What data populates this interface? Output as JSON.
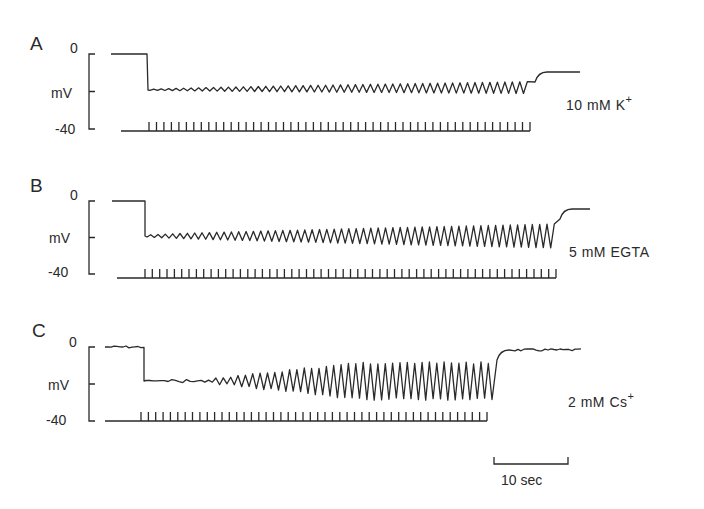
{
  "chart_data": {
    "type": "line",
    "title": "",
    "xlabel": "time",
    "ylabel": "mV",
    "scale_bar": {
      "label": "10 sec",
      "seconds": 10
    },
    "panels": [
      {
        "id": "A",
        "label": "A",
        "condition": "10 mM  K +",
        "y_ticks": [
          "0",
          "mV",
          "-40"
        ],
        "ylim": [
          -40,
          0
        ],
        "resting_mV": 0,
        "hyperpolarized_mV": -19,
        "recovery_mV": -9,
        "oscillation_amplitude_mV": {
          "start": 0.5,
          "end": 6
        },
        "stimulus_count": 52,
        "description": "Small oscillations grow gradually during stimulus train; potential returns toward -9 mV after train"
      },
      {
        "id": "B",
        "label": "B",
        "condition": "5 mM  EGTA",
        "y_ticks": [
          "0",
          "mV",
          "-40"
        ],
        "ylim": [
          -40,
          0
        ],
        "resting_mV": 0,
        "hyperpolarized_mV": -19,
        "recovery_mV": -4,
        "oscillation_amplitude_mV": {
          "start": 1,
          "end": 14
        },
        "stimulus_count": 57,
        "description": "Oscillations grow steadily during stimulus train; recovery near -4 mV"
      },
      {
        "id": "C",
        "label": "C",
        "condition": "2 mM  Cs +",
        "y_ticks": [
          "0",
          "mV",
          "-40"
        ],
        "ylim": [
          -40,
          0
        ],
        "resting_mV": 0,
        "hyperpolarized_mV": -19,
        "recovery_mV": -2,
        "oscillation_amplitude_mV": {
          "start": 0.5,
          "end": 20
        },
        "stimulus_count": 48,
        "description": "Noisy trace; large oscillations develop after ~8 stimuli; recovery near -2 mV"
      }
    ]
  },
  "panels": {
    "a": {
      "label": "A",
      "zero": "0",
      "unit": "mV",
      "minus40": "-40",
      "condition": "10 mM   K",
      "ion_sup": "+"
    },
    "b": {
      "label": "B",
      "zero": "0",
      "unit": "mV",
      "minus40": "-40",
      "condition": "5 mM   EGTA",
      "ion_sup": ""
    },
    "c": {
      "label": "C",
      "zero": "0",
      "unit": "mV",
      "minus40": "-40",
      "condition": "2 mM   Cs",
      "ion_sup": "+"
    }
  },
  "scale_bar": {
    "label": "10 sec"
  },
  "geometry": {
    "A": {
      "top": 54,
      "bottom": 129,
      "axis_x": 89,
      "trace_start": 111,
      "step_x": 148,
      "osc_y": 90,
      "osc_end": 531,
      "amp_start": 1,
      "amp_end": 12,
      "rec_y": 72,
      "rec_end": 580,
      "stim_y": 131,
      "stim_start": 121,
      "stim_first": 149,
      "stim_end": 530,
      "noise": 0,
      "delay": 0
    },
    "B": {
      "top": 201,
      "bottom": 274,
      "axis_x": 89,
      "trace_start": 112,
      "step_x": 145,
      "osc_y": 236,
      "osc_end": 556,
      "amp_start": 2,
      "amp_end": 24,
      "rec_y": 209,
      "rec_end": 590,
      "stim_y": 278,
      "stim_start": 117,
      "stim_first": 145,
      "stim_end": 556,
      "noise": 0,
      "delay": 0
    },
    "C": {
      "top": 347,
      "bottom": 421,
      "axis_x": 89,
      "trace_start": 105,
      "step_x": 144,
      "osc_y": 381,
      "osc_end": 493,
      "amp_start": 1,
      "amp_end": 36,
      "rec_y": 350,
      "rec_end": 582,
      "stim_y": 421,
      "stim_start": 105,
      "stim_first": 141,
      "stim_end": 487,
      "noise": 1.2,
      "delay": 55
    }
  }
}
